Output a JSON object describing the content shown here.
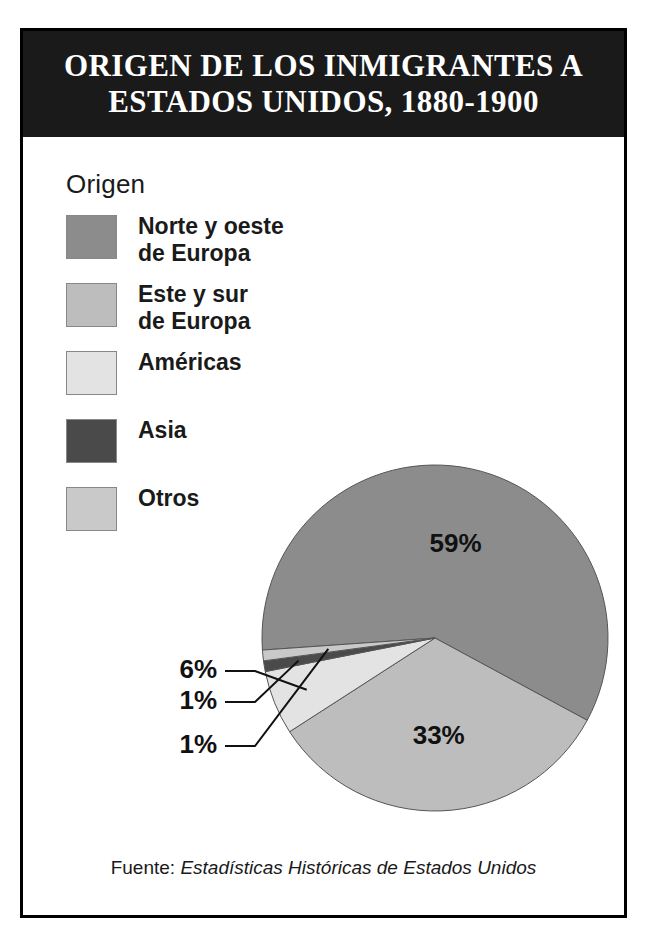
{
  "title": "ORIGEN DE LOS INMIGRANTES A\nESTADOS UNIDOS, 1880-1900",
  "legend": {
    "title": "Origen",
    "items": [
      {
        "label": "Norte y oeste\nde Europa",
        "color": "#8c8c8c"
      },
      {
        "label": "Este y sur\nde Europa",
        "color": "#bdbdbd"
      },
      {
        "label": "Américas",
        "color": "#e3e3e3"
      },
      {
        "label": "Asia",
        "color": "#4a4a4a"
      },
      {
        "label": "Otros",
        "color": "#c9c9c9"
      }
    ]
  },
  "source": {
    "prefix": "Fuente: ",
    "italic": "Estadísticas Históricas de Estados Unidos"
  },
  "chart_data": {
    "type": "pie",
    "title": "ORIGEN DE LOS INMIGRANTES A ESTADOS UNIDOS, 1880-1900",
    "xlabel": "",
    "ylabel": "",
    "legend_title": "Origen",
    "legend_position": "upper-left",
    "grid": false,
    "units": "percent",
    "categories": [
      "Norte y oeste de Europa",
      "Este y sur de Europa",
      "Américas",
      "Asia",
      "Otros"
    ],
    "values": [
      59,
      33,
      6,
      1,
      1
    ],
    "colors": [
      "#8c8c8c",
      "#bdbdbd",
      "#e3e3e3",
      "#4a4a4a",
      "#c9c9c9"
    ],
    "labels": [
      "59%",
      "33%",
      "6%",
      "1%",
      "1%"
    ],
    "label_placement": [
      "inside",
      "inside",
      "callout",
      "callout",
      "callout"
    ],
    "start_angle_deg": 184,
    "direction": "clockwise",
    "annotations": [
      "59%",
      "33%",
      "6%",
      "1%",
      "1%"
    ],
    "source": "Fuente: Estadísticas Históricas de Estados Unidos"
  }
}
